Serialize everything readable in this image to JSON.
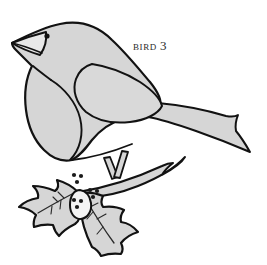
{
  "figure": {
    "caption_label": "Bird",
    "caption_number": "3",
    "caption_full": "BIRD 3",
    "style": "black line art with flat light-gray fill"
  },
  "colors": {
    "background": "#ffffff",
    "outline": "#121212",
    "fill": "#d6d6d6",
    "fill_light": "#dcdcdc",
    "berry": "#1a1a1a",
    "caption_text": "#2b2b2b",
    "vein": "#2a2a2a"
  },
  "elements": {
    "bird_body": "bird-body",
    "bird_head": "bird-head",
    "bird_beak": "bird-beak",
    "bird_eye": "bird-eye",
    "bird_wing": "bird-wing",
    "bird_breast": "bird-breast",
    "bird_tail": "bird-tail",
    "bird_legs": "bird-legs",
    "branch": "holly-branch",
    "leaf_left": "holly-leaf-left",
    "leaf_right": "holly-leaf-right",
    "berries": "holly-berries"
  },
  "berry_clusters": [
    {
      "name": "berry-cluster-top",
      "cx": 77,
      "cy": 179,
      "count": 3
    },
    {
      "name": "berry-cluster-middle",
      "cx": 93,
      "cy": 194,
      "count": 3
    },
    {
      "name": "berry-cluster-bottom",
      "cx": 77,
      "cy": 203,
      "count": 3
    }
  ],
  "geometry": {
    "canvas_width": 267,
    "canvas_height": 265,
    "beak_tip": [
      12,
      43
    ],
    "tail_tip": [
      250,
      152
    ],
    "perch_point": [
      80,
      192
    ]
  }
}
